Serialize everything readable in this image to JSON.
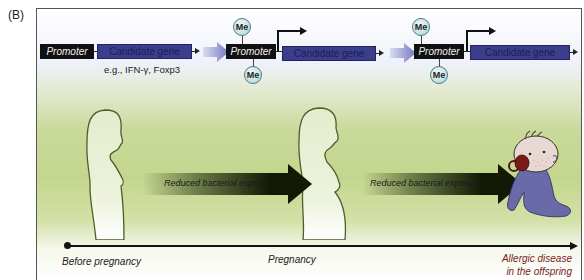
{
  "panel_label": "(B)",
  "stages": [
    {
      "promoter_label": "Promoter",
      "gene_label": "Candidate gene",
      "example_text": "e.g., IFN-γ, Foxp3",
      "methylated": false
    },
    {
      "promoter_label": "Promoter",
      "gene_label": "Candidate gene",
      "methyl_marks": [
        "Me",
        "Me"
      ],
      "methylated": true
    },
    {
      "promoter_label": "Promoter",
      "gene_label": "Candidate gene",
      "methyl_marks": [
        "Me",
        "Me"
      ],
      "methylated": true
    }
  ],
  "arrows": [
    {
      "label": "Reduced bacterial exposure"
    },
    {
      "label": "Reduced bacterial exposure"
    }
  ],
  "figures": [
    "woman-silhouette",
    "pregnant-woman-silhouette",
    "baby-with-pacifier"
  ],
  "timeline": {
    "start": "Before pregnancy",
    "middle": "Pregnancy",
    "end_line1": "Allergic disease",
    "end_line2": "in the offspring"
  },
  "colors": {
    "promoter": "#111111",
    "gene": "#3b3e8c",
    "methyl": "#bfe0e0",
    "outcome_text": "#7a1a1a",
    "background_green": "#c4d68e"
  }
}
